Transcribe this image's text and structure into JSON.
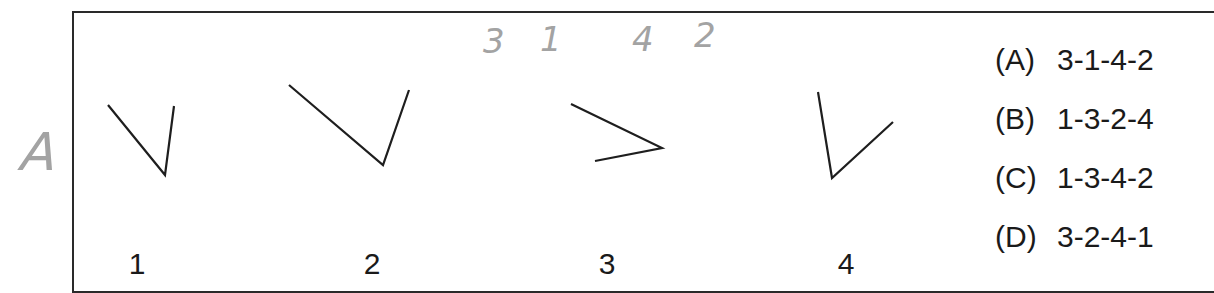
{
  "question": {
    "figures": [
      {
        "label": "1",
        "label_x": 137,
        "polyline": "108,105 165,175 174,106"
      },
      {
        "label": "2",
        "label_x": 372,
        "polyline": "289,85 383,165 409,90"
      },
      {
        "label": "3",
        "label_x": 607,
        "polyline": "571,104 662,148 595,161"
      },
      {
        "label": "4",
        "label_x": 846,
        "polyline": "818,92 832,178 893,122"
      }
    ],
    "options": [
      {
        "letter": "(A)",
        "sequence": "3-1-4-2"
      },
      {
        "letter": "(B)",
        "sequence": "1-3-2-4"
      },
      {
        "letter": "(C)",
        "sequence": "1-3-4-2"
      },
      {
        "letter": "(D)",
        "sequence": "3-2-4-1"
      }
    ]
  },
  "handwriting": {
    "answer_mark": "A",
    "sequence_marks": [
      "3",
      "1",
      "4",
      "2"
    ],
    "color": "#a3a3a3"
  },
  "colors": {
    "ink": "#1e1e1e",
    "frame": "#2a2a2a",
    "pencil": "#a3a3a3",
    "background": "#ffffff"
  }
}
